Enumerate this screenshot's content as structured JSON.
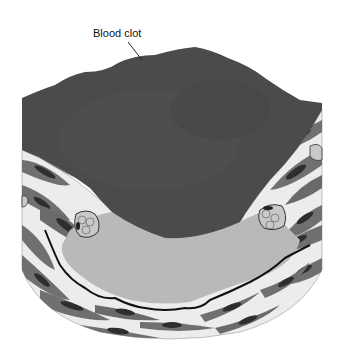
{
  "figure": {
    "labels": [
      {
        "id": "blood-clot",
        "text": "Blood clot",
        "x": 93,
        "y": 27,
        "pointer": {
          "x1": 128,
          "y1": 42,
          "x2": 142,
          "y2": 60
        }
      }
    ],
    "colors": {
      "background": "#ffffff",
      "clot": "#4b4b4b",
      "plaque": "#b9b9b9",
      "wall": "#ececec",
      "muscle": "#707070",
      "nucleus": "#2e2e2e",
      "elastic_lamina": "#111111",
      "foam_cell": "#c8c8c8"
    },
    "regions": [
      "blood clot",
      "atherosclerotic plaque",
      "arterial wall (smooth muscle layer)",
      "foam cells"
    ]
  }
}
